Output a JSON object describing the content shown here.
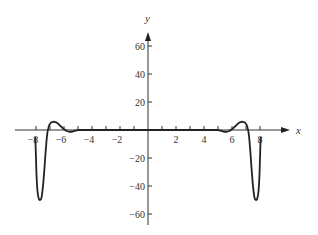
{
  "chart_data": {
    "type": "line",
    "title": "",
    "xlabel": "x",
    "ylabel": "y",
    "xlim": [
      -9,
      9
    ],
    "ylim": [
      -65,
      70
    ],
    "grid": false,
    "legend": null,
    "x_ticks": [
      -8,
      -6,
      -4,
      -2,
      2,
      4,
      6,
      8
    ],
    "x_minor_ticks": [
      -7,
      -5,
      -3,
      -1,
      1,
      3,
      5,
      7
    ],
    "y_ticks": [
      -60,
      -40,
      -20,
      20,
      40,
      60
    ],
    "x_tick_labels": [
      "−8",
      "−6",
      "−4",
      "−2",
      "2",
      "4",
      "6",
      "8"
    ],
    "y_tick_labels": [
      "−60",
      "−40",
      "−20",
      "20",
      "40",
      "60"
    ],
    "series": [
      {
        "name": "f(x)",
        "color": "#222222",
        "symmetry": "even",
        "points": [
          [
            -8.05,
            -5
          ],
          [
            -8.0,
            -20
          ],
          [
            -7.95,
            -35
          ],
          [
            -7.88,
            -45
          ],
          [
            -7.8,
            -49
          ],
          [
            -7.7,
            -50
          ],
          [
            -7.6,
            -48
          ],
          [
            -7.5,
            -40
          ],
          [
            -7.4,
            -28
          ],
          [
            -7.3,
            -14
          ],
          [
            -7.2,
            -3
          ],
          [
            -7.1,
            2
          ],
          [
            -7.0,
            4.5
          ],
          [
            -6.8,
            5.8
          ],
          [
            -6.6,
            5.6
          ],
          [
            -6.4,
            4.3
          ],
          [
            -6.2,
            2.4
          ],
          [
            -6.0,
            0.6
          ],
          [
            -5.8,
            -0.7
          ],
          [
            -5.6,
            -1.3
          ],
          [
            -5.4,
            -1.1
          ],
          [
            -5.2,
            -0.5
          ],
          [
            -5.0,
            -0.1
          ],
          [
            -4.5,
            0
          ],
          [
            0,
            0
          ],
          [
            4.5,
            0
          ],
          [
            5.0,
            -0.1
          ],
          [
            5.2,
            -0.5
          ],
          [
            5.4,
            -1.1
          ],
          [
            5.6,
            -1.3
          ],
          [
            5.8,
            -0.7
          ],
          [
            6.0,
            0.6
          ],
          [
            6.2,
            2.4
          ],
          [
            6.4,
            4.3
          ],
          [
            6.6,
            5.6
          ],
          [
            6.8,
            5.8
          ],
          [
            7.0,
            4.5
          ],
          [
            7.1,
            2
          ],
          [
            7.2,
            -3
          ],
          [
            7.3,
            -14
          ],
          [
            7.4,
            -28
          ],
          [
            7.5,
            -40
          ],
          [
            7.6,
            -48
          ],
          [
            7.7,
            -50
          ],
          [
            7.8,
            -49
          ],
          [
            7.88,
            -45
          ],
          [
            7.95,
            -35
          ],
          [
            8.0,
            -20
          ],
          [
            8.05,
            -5
          ]
        ]
      }
    ],
    "annotations": []
  },
  "layout": {
    "origin_px": [
      148,
      130
    ],
    "px_per_x_unit": 14,
    "px_per_y_unit": 1.4,
    "x_axis_px": [
      15,
      290
    ],
    "y_axis_px": [
      32,
      225
    ]
  }
}
